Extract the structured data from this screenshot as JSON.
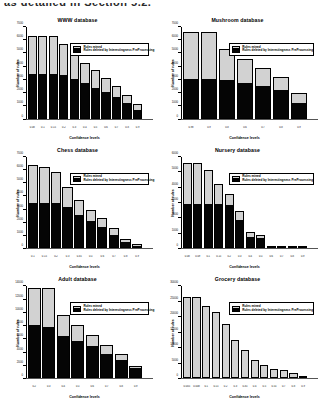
{
  "page": {
    "top_text": "as detailed in Section 5.2."
  },
  "legend": {
    "mined_label": "Rules mined",
    "deleted_label": "Rules deleted by Interestingness PreProcessing",
    "mined_color": "#d2d2d2",
    "deleted_color": "#050505"
  },
  "axis": {
    "ylabel": "Number of rules",
    "xlabel": "Confidence levels"
  },
  "chart_data": [
    {
      "type": "bar",
      "title": "WWW database",
      "xlabel": "Confidence levels",
      "ylabel": "Number of rules",
      "categories": [
        "0.08",
        "0.1",
        "0.15",
        "0.2",
        "0.3",
        "0.4",
        "0.5",
        "0.6",
        "0.7",
        "0.8",
        "0.9"
      ],
      "yticks": [
        0,
        1000,
        2000,
        3000,
        4000,
        5000,
        6000,
        7000
      ],
      "ylim": [
        0,
        7000
      ],
      "series": [
        {
          "name": "Rules deleted by Interestingness PreProcessing",
          "values": [
            3400,
            3400,
            3400,
            3350,
            3050,
            2750,
            2400,
            2050,
            1700,
            1200,
            700
          ]
        },
        {
          "name": "Rules mined",
          "values": [
            6300,
            6300,
            6300,
            5700,
            4900,
            4250,
            3700,
            3100,
            2500,
            1800,
            1150
          ]
        }
      ]
    },
    {
      "type": "bar",
      "title": "Mushroom database",
      "xlabel": "Confidence levels",
      "ylabel": "Number of rules",
      "categories": [
        "0.98",
        "0.9",
        "0.8",
        "0.6",
        "0.7",
        "0.8",
        "0.9"
      ],
      "yticks": [
        0,
        1000,
        2000,
        3000,
        4000,
        5000,
        6000,
        7000
      ],
      "ylim": [
        0,
        7000
      ],
      "series": [
        {
          "name": "Rules deleted by Interestingness PreProcessing",
          "values": [
            3050,
            3050,
            2950,
            2750,
            2500,
            2200,
            1250
          ]
        },
        {
          "name": "Rules mined",
          "values": [
            6600,
            6600,
            5350,
            4550,
            3850,
            3150,
            1950
          ]
        }
      ]
    },
    {
      "type": "bar",
      "title": "Chess database",
      "xlabel": "Confidence levels",
      "ylabel": "Number of rules",
      "categories": [
        "0.1",
        "0.15",
        "0.2",
        "0.3",
        "0.35",
        "0.5",
        "0.6",
        "0.7",
        "0.8",
        "0.9"
      ],
      "yticks": [
        0,
        1000,
        2000,
        3000,
        4000,
        5000,
        6000,
        7000
      ],
      "ylim": [
        0,
        7000
      ],
      "series": [
        {
          "name": "Rules deleted by Interestingness PreProcessing",
          "values": [
            3450,
            3450,
            3450,
            3150,
            2600,
            2100,
            1650,
            1050,
            500,
            180
          ]
        },
        {
          "name": "Rules mined",
          "values": [
            6400,
            6200,
            5800,
            4700,
            3700,
            2950,
            2350,
            1550,
            750,
            300
          ]
        }
      ]
    },
    {
      "type": "bar",
      "title": "Nursery database",
      "xlabel": "Confidence levels",
      "ylabel": "Number of rules",
      "categories": [
        "0.08",
        "0.09",
        "0.1",
        "0.15",
        "0.2",
        "0.3",
        "0.4",
        "0.5",
        "0.6",
        "0.7",
        "0.8",
        "0.9"
      ],
      "yticks": [
        0,
        1000,
        2000,
        3000,
        4000,
        5000,
        6000
      ],
      "ylim": [
        0,
        6000
      ],
      "series": [
        {
          "name": "Rules deleted by Interestingness PreProcessing",
          "values": [
            2900,
            2900,
            2900,
            2900,
            2850,
            1900,
            800,
            700,
            100,
            60,
            30,
            20
          ]
        },
        {
          "name": "Rules mined",
          "values": [
            5600,
            5600,
            5150,
            4200,
            3550,
            2450,
            1050,
            850,
            160,
            90,
            60,
            40
          ]
        }
      ]
    },
    {
      "type": "bar",
      "title": "Adult database",
      "xlabel": "Confidence levels",
      "ylabel": "Number of rules",
      "categories": [
        "0.2",
        "0.3",
        "0.4",
        "0.5",
        "0.6",
        "0.7",
        "0.8",
        "0.9"
      ],
      "yticks": [
        0,
        2000,
        4000,
        6000,
        8000,
        10000,
        12000,
        14000
      ],
      "ylim": [
        0,
        14000
      ],
      "series": [
        {
          "name": "Rules deleted by Interestingness PreProcessing",
          "values": [
            8200,
            7800,
            6400,
            5700,
            4900,
            3800,
            2800,
            1750
          ]
        },
        {
          "name": "Rules mined",
          "values": [
            13700,
            13700,
            9600,
            8100,
            6600,
            5100,
            3700,
            1800
          ]
        }
      ]
    },
    {
      "type": "bar",
      "title": "Grocery database",
      "xlabel": "Confidence levels",
      "ylabel": "Number of rules",
      "categories": [
        "0.005",
        "0.008",
        "0.1",
        "0.15",
        "0.2",
        "0.3",
        "0.35",
        "0.4",
        "0.5",
        "0.55",
        "0.7",
        "0.8",
        "0.9"
      ],
      "yticks": [
        0,
        5000,
        10000,
        15000,
        20000,
        25000,
        30000
      ],
      "ylim": [
        0,
        30000
      ],
      "series": [
        {
          "name": "Rules deleted by Interestingness PreProcessing",
          "values": [
            0,
            0,
            0,
            0,
            0,
            0,
            0,
            0,
            0,
            0,
            0,
            0,
            0
          ]
        },
        {
          "name": "Rules mined",
          "values": [
            26500,
            26500,
            23500,
            21500,
            17800,
            12500,
            9200,
            6000,
            4200,
            3100,
            2600,
            1700,
            0
          ]
        }
      ]
    }
  ]
}
